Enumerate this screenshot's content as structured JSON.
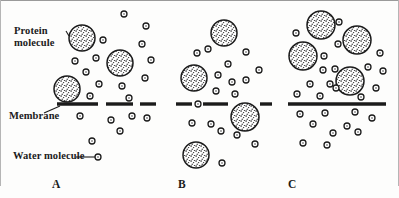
{
  "figure": {
    "background_color": "#fdfdfc",
    "ink_color": "#1b1b1b"
  },
  "labels": {
    "protein_line1": "Protein",
    "protein_line2": "molecule",
    "membrane": "Membrane",
    "water": "Water molecule"
  },
  "panels": [
    {
      "id": "A",
      "letter": "A",
      "membrane_style": "dashed",
      "membrane_y": 104,
      "membrane_x_start": 57,
      "membrane_x_end": 156,
      "membrane_segments": [
        [
          57,
          98
        ],
        [
          106,
          133
        ],
        [
          140,
          156
        ]
      ],
      "proteins_above": 3,
      "proteins_crossing": 0,
      "proteins_below": 0,
      "water_above": 13,
      "water_below": 8
    },
    {
      "id": "B",
      "letter": "B",
      "membrane_style": "dashed",
      "membrane_y": 104,
      "membrane_x_start": 176,
      "membrane_x_end": 272,
      "membrane_segments": [
        [
          176,
          192
        ],
        [
          203,
          228
        ],
        [
          260,
          272
        ]
      ],
      "proteins_above": 2,
      "proteins_crossing": 1,
      "proteins_below": 1,
      "water_above": 10,
      "water_below": 8
    },
    {
      "id": "C",
      "letter": "C",
      "membrane_style": "solid",
      "membrane_y": 104,
      "membrane_x_start": 288,
      "membrane_x_end": 386,
      "membrane_segments": [
        [
          288,
          386
        ]
      ],
      "proteins_above": 4,
      "proteins_crossing": 0,
      "proteins_below": 0,
      "water_above": 12,
      "water_below": 11
    }
  ],
  "proteins": [
    {
      "panel": "A",
      "cx": 82,
      "cy": 38,
      "r": 13,
      "position": "above"
    },
    {
      "panel": "A",
      "cx": 120,
      "cy": 63,
      "r": 13,
      "position": "above"
    },
    {
      "panel": "A",
      "cx": 67,
      "cy": 89,
      "r": 13,
      "position": "above"
    },
    {
      "panel": "B",
      "cx": 224,
      "cy": 33,
      "r": 13,
      "position": "above"
    },
    {
      "panel": "B",
      "cx": 194,
      "cy": 78,
      "r": 13,
      "position": "above"
    },
    {
      "panel": "B",
      "cx": 245,
      "cy": 117,
      "r": 14,
      "position": "crossing"
    },
    {
      "panel": "B",
      "cx": 196,
      "cy": 155,
      "r": 13,
      "position": "below"
    },
    {
      "panel": "C",
      "cx": 321,
      "cy": 25,
      "r": 14,
      "position": "above"
    },
    {
      "panel": "C",
      "cx": 357,
      "cy": 40,
      "r": 14,
      "position": "above"
    },
    {
      "panel": "C",
      "cx": 303,
      "cy": 56,
      "r": 14,
      "position": "above"
    },
    {
      "panel": "C",
      "cx": 350,
      "cy": 81,
      "r": 14,
      "position": "above"
    }
  ],
  "waters": [
    {
      "panel": "A",
      "cx": 124,
      "cy": 14,
      "r": 3
    },
    {
      "panel": "A",
      "cx": 146,
      "cy": 26,
      "r": 3
    },
    {
      "panel": "A",
      "cx": 103,
      "cy": 40,
      "r": 3
    },
    {
      "panel": "A",
      "cx": 142,
      "cy": 44,
      "r": 3
    },
    {
      "panel": "A",
      "cx": 75,
      "cy": 61,
      "r": 3
    },
    {
      "panel": "A",
      "cx": 96,
      "cy": 58,
      "r": 3
    },
    {
      "panel": "A",
      "cx": 151,
      "cy": 60,
      "r": 3
    },
    {
      "panel": "A",
      "cx": 86,
      "cy": 72,
      "r": 3
    },
    {
      "panel": "A",
      "cx": 145,
      "cy": 78,
      "r": 3
    },
    {
      "panel": "A",
      "cx": 99,
      "cy": 84,
      "r": 3
    },
    {
      "panel": "A",
      "cx": 122,
      "cy": 86,
      "r": 3
    },
    {
      "panel": "A",
      "cx": 90,
      "cy": 96,
      "r": 3
    },
    {
      "panel": "A",
      "cx": 129,
      "cy": 98,
      "r": 3
    },
    {
      "panel": "A",
      "cx": 80,
      "cy": 116,
      "r": 3
    },
    {
      "panel": "A",
      "cx": 111,
      "cy": 120,
      "r": 3
    },
    {
      "panel": "A",
      "cx": 132,
      "cy": 116,
      "r": 3
    },
    {
      "panel": "A",
      "cx": 147,
      "cy": 118,
      "r": 3
    },
    {
      "panel": "A",
      "cx": 120,
      "cy": 131,
      "r": 3
    },
    {
      "panel": "A",
      "cx": 92,
      "cy": 141,
      "r": 3
    },
    {
      "panel": "A",
      "cx": 98,
      "cy": 157,
      "r": 3
    },
    {
      "panel": "B",
      "cx": 197,
      "cy": 53,
      "r": 3
    },
    {
      "panel": "B",
      "cx": 208,
      "cy": 49,
      "r": 3
    },
    {
      "panel": "B",
      "cx": 246,
      "cy": 52,
      "r": 3
    },
    {
      "panel": "B",
      "cx": 228,
      "cy": 64,
      "r": 3
    },
    {
      "panel": "B",
      "cx": 218,
      "cy": 75,
      "r": 3
    },
    {
      "panel": "B",
      "cx": 259,
      "cy": 70,
      "r": 3
    },
    {
      "panel": "B",
      "cx": 232,
      "cy": 82,
      "r": 3
    },
    {
      "panel": "B",
      "cx": 246,
      "cy": 80,
      "r": 3
    },
    {
      "panel": "B",
      "cx": 216,
      "cy": 91,
      "r": 3
    },
    {
      "panel": "B",
      "cx": 235,
      "cy": 94,
      "r": 3
    },
    {
      "panel": "B",
      "cx": 198,
      "cy": 104,
      "r": 3
    },
    {
      "panel": "B",
      "cx": 192,
      "cy": 123,
      "r": 3
    },
    {
      "panel": "B",
      "cx": 211,
      "cy": 124,
      "r": 3
    },
    {
      "panel": "B",
      "cx": 221,
      "cy": 131,
      "r": 3
    },
    {
      "panel": "B",
      "cx": 237,
      "cy": 135,
      "r": 3
    },
    {
      "panel": "B",
      "cx": 255,
      "cy": 144,
      "r": 3
    },
    {
      "panel": "B",
      "cx": 222,
      "cy": 163,
      "r": 3
    },
    {
      "panel": "C",
      "cx": 296,
      "cy": 33,
      "r": 3
    },
    {
      "panel": "C",
      "cx": 339,
      "cy": 22,
      "r": 3
    },
    {
      "panel": "C",
      "cx": 338,
      "cy": 44,
      "r": 3
    },
    {
      "panel": "C",
      "cx": 324,
      "cy": 56,
      "r": 3
    },
    {
      "panel": "C",
      "cx": 380,
      "cy": 53,
      "r": 3
    },
    {
      "panel": "C",
      "cx": 323,
      "cy": 70,
      "r": 3
    },
    {
      "panel": "C",
      "cx": 335,
      "cy": 69,
      "r": 3
    },
    {
      "panel": "C",
      "cx": 368,
      "cy": 67,
      "r": 3
    },
    {
      "panel": "C",
      "cx": 383,
      "cy": 71,
      "r": 3
    },
    {
      "panel": "C",
      "cx": 310,
      "cy": 84,
      "r": 3
    },
    {
      "panel": "C",
      "cx": 330,
      "cy": 84,
      "r": 3
    },
    {
      "panel": "C",
      "cx": 376,
      "cy": 88,
      "r": 3
    },
    {
      "panel": "C",
      "cx": 297,
      "cy": 94,
      "r": 3
    },
    {
      "panel": "C",
      "cx": 320,
      "cy": 96,
      "r": 3
    },
    {
      "panel": "C",
      "cx": 336,
      "cy": 88,
      "r": 3
    },
    {
      "panel": "C",
      "cx": 361,
      "cy": 97,
      "r": 3
    },
    {
      "panel": "C",
      "cx": 300,
      "cy": 114,
      "r": 3
    },
    {
      "panel": "C",
      "cx": 325,
      "cy": 113,
      "r": 3
    },
    {
      "panel": "C",
      "cx": 355,
      "cy": 112,
      "r": 3
    },
    {
      "panel": "C",
      "cx": 372,
      "cy": 118,
      "r": 3
    },
    {
      "panel": "C",
      "cx": 313,
      "cy": 124,
      "r": 3
    },
    {
      "panel": "C",
      "cx": 347,
      "cy": 126,
      "r": 3
    },
    {
      "panel": "C",
      "cx": 333,
      "cy": 133,
      "r": 3
    },
    {
      "panel": "C",
      "cx": 358,
      "cy": 132,
      "r": 3
    },
    {
      "panel": "C",
      "cx": 303,
      "cy": 143,
      "r": 3
    },
    {
      "panel": "C",
      "cx": 327,
      "cy": 145,
      "r": 3
    }
  ],
  "leaders": {
    "protein": {
      "x1": 68,
      "y1": 33,
      "x2": 71,
      "y2": 34
    },
    "water": {
      "x1": 76,
      "y1": 157,
      "x2": 95,
      "y2": 157
    }
  }
}
